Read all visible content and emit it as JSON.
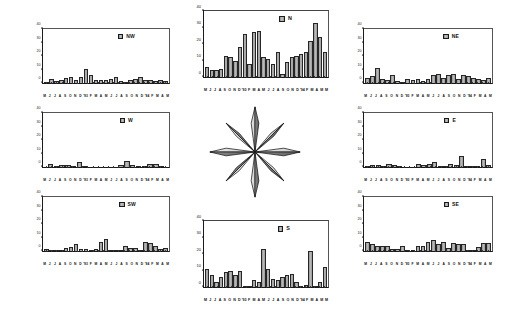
{
  "figure": {
    "panel_count": 8,
    "center_graphic": "compass-rose"
  },
  "axes": {
    "y_ticks": [
      0,
      10,
      20,
      30,
      40
    ],
    "y_min": 0,
    "y_max": 40,
    "y_label": "",
    "x_label": "",
    "x_tick_labels": [
      "M",
      "J",
      "J",
      "A",
      "S",
      "O",
      "N",
      "D",
      "'93",
      "F",
      "M",
      "A",
      "M",
      "J",
      "J",
      "A",
      "S",
      "O",
      "N",
      "D",
      "'94",
      "F",
      "M",
      "A",
      "M"
    ],
    "x_tick_labels_joined": "M J J A S O N D '93 F M A M J J A S O N D '94 F M A M",
    "grid": false,
    "legend_position": "top-right inside plot"
  },
  "style": {
    "bar_fill": "#bdbdbd",
    "bar_edge": "#262626",
    "axis_color": "#1a1a1a",
    "background": "#ffffff",
    "legend_swatch": "#c4c4c4"
  },
  "chart_data": [
    {
      "type": "bar",
      "title": "NW",
      "panel": "nw",
      "xlabel": "",
      "ylabel": "",
      "ylim": [
        0,
        40
      ],
      "categories": [
        "M",
        "J",
        "J",
        "A",
        "S",
        "O",
        "N",
        "D",
        "'93",
        "F",
        "M",
        "A",
        "M",
        "J",
        "J",
        "A",
        "S",
        "O",
        "N",
        "D",
        "'94",
        "F",
        "M",
        "A",
        "M"
      ],
      "values": [
        0.5,
        3,
        1.5,
        2.5,
        4,
        4.5,
        2.5,
        4.5,
        10.5,
        6,
        2.5,
        2,
        2.5,
        3,
        4.5,
        1.5,
        1,
        2.5,
        3,
        4.5,
        2,
        2.5,
        1.5,
        2,
        1.5
      ]
    },
    {
      "type": "bar",
      "title": "N",
      "panel": "n",
      "xlabel": "",
      "ylabel": "",
      "ylim": [
        0,
        40
      ],
      "categories": [
        "M",
        "J",
        "J",
        "A",
        "S",
        "O",
        "N",
        "D",
        "'93",
        "F",
        "M",
        "A",
        "M",
        "J",
        "J",
        "A",
        "S",
        "O",
        "N",
        "D",
        "'94",
        "F",
        "M",
        "A",
        "M"
      ],
      "values": [
        6,
        4,
        4,
        5,
        13,
        12,
        10,
        18,
        26,
        8,
        27,
        28,
        12,
        11,
        8,
        15,
        2,
        9,
        12,
        13,
        14,
        15,
        22,
        33,
        24,
        15
      ]
    },
    {
      "type": "bar",
      "title": "NE",
      "panel": "ne",
      "xlabel": "",
      "ylabel": "",
      "ylim": [
        0,
        40
      ],
      "categories": [
        "M",
        "J",
        "J",
        "A",
        "S",
        "O",
        "N",
        "D",
        "'93",
        "F",
        "M",
        "A",
        "M",
        "J",
        "J",
        "A",
        "S",
        "O",
        "N",
        "D",
        "'94",
        "F",
        "M",
        "A",
        "M"
      ],
      "values": [
        4,
        5,
        11,
        3,
        2,
        6,
        1.5,
        1,
        3,
        2,
        3,
        1.5,
        3,
        6,
        7,
        4,
        6,
        7,
        3,
        6,
        5,
        4,
        3,
        2,
        4
      ]
    },
    {
      "type": "bar",
      "title": "W",
      "panel": "w",
      "xlabel": "",
      "ylabel": "",
      "ylim": [
        0,
        40
      ],
      "categories": [
        "M",
        "J",
        "J",
        "A",
        "S",
        "O",
        "N",
        "D",
        "'93",
        "F",
        "M",
        "A",
        "M",
        "J",
        "J",
        "A",
        "S",
        "O",
        "N",
        "D",
        "'94",
        "F",
        "M",
        "A",
        "M"
      ],
      "values": [
        0,
        2,
        0.3,
        1.5,
        1.5,
        0.3,
        4,
        0.5,
        0,
        0,
        0,
        0,
        0,
        0,
        0,
        0,
        1.5,
        4.5,
        1.5,
        0.5,
        0.5,
        2.5,
        2.5,
        0.5,
        0
      ]
    },
    {
      "type": "bar",
      "title": "E",
      "panel": "e",
      "xlabel": "",
      "ylabel": "",
      "ylim": [
        0,
        40
      ],
      "categories": [
        "M",
        "J",
        "J",
        "A",
        "S",
        "O",
        "N",
        "D",
        "'93",
        "F",
        "M",
        "A",
        "M",
        "J",
        "J",
        "A",
        "S",
        "O",
        "N",
        "D",
        "'94",
        "F",
        "M",
        "A",
        "M"
      ],
      "values": [
        0.5,
        1.5,
        1.5,
        0.5,
        2,
        1.5,
        0.5,
        0,
        0,
        0,
        0,
        2.5,
        1.5,
        2,
        4,
        1,
        0.5,
        2.5,
        1.5,
        8.5,
        1,
        0.5,
        0.5,
        6,
        1.5
      ]
    },
    {
      "type": "bar",
      "title": "SW",
      "panel": "sw",
      "xlabel": "",
      "ylabel": "",
      "ylim": [
        0,
        40
      ],
      "categories": [
        "M",
        "J",
        "J",
        "A",
        "S",
        "O",
        "N",
        "D",
        "'93",
        "F",
        "M",
        "A",
        "M",
        "J",
        "J",
        "A",
        "S",
        "O",
        "N",
        "D",
        "'94",
        "F",
        "M",
        "A",
        "M"
      ],
      "values": [
        1.5,
        0.5,
        0.5,
        1,
        2.5,
        3,
        5,
        1.5,
        1.5,
        1,
        1.5,
        7,
        9,
        0.5,
        0.5,
        1,
        4,
        2,
        2,
        1,
        6.5,
        6,
        4,
        1.5,
        2
      ]
    },
    {
      "type": "bar",
      "title": "S",
      "panel": "s",
      "xlabel": "",
      "ylabel": "",
      "ylim": [
        0,
        40
      ],
      "categories": [
        "M",
        "J",
        "J",
        "A",
        "S",
        "O",
        "N",
        "D",
        "'93",
        "F",
        "M",
        "A",
        "M",
        "J",
        "J",
        "A",
        "S",
        "O",
        "N",
        "D",
        "'94",
        "F",
        "M",
        "A",
        "M"
      ],
      "values": [
        11,
        7,
        3,
        6,
        9,
        10,
        7,
        10,
        0.5,
        0.5,
        4,
        3,
        23,
        11,
        5,
        4,
        6,
        7,
        8,
        3,
        0.5,
        1,
        22,
        0.5,
        3,
        12
      ]
    },
    {
      "type": "bar",
      "title": "SE",
      "panel": "se",
      "xlabel": "",
      "ylabel": "",
      "ylim": [
        0,
        40
      ],
      "categories": [
        "M",
        "J",
        "J",
        "A",
        "S",
        "O",
        "N",
        "D",
        "'93",
        "F",
        "M",
        "A",
        "M",
        "J",
        "J",
        "A",
        "S",
        "O",
        "N",
        "D",
        "'94",
        "F",
        "M",
        "A",
        "M"
      ],
      "values": [
        7,
        5,
        4,
        4,
        4,
        1.5,
        1.5,
        4,
        1,
        1,
        4,
        4,
        7,
        8,
        5,
        7,
        2,
        6,
        5,
        5,
        1,
        0.5,
        3,
        6,
        6
      ]
    }
  ]
}
